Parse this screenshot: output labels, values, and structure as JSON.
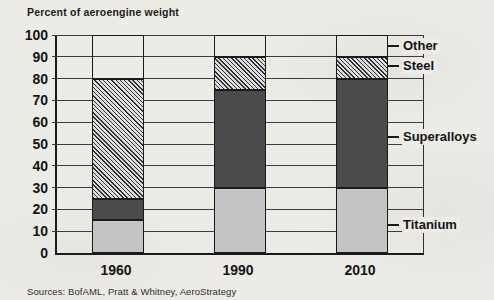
{
  "page": {
    "title": "Percent of aeroengine weight",
    "source_note": "Sources: BofAML, Pratt & Whitney, AeroStrategy"
  },
  "chart_data": {
    "type": "bar",
    "stacked": true,
    "title": "Percent of aeroengine weight",
    "categories": [
      "1960",
      "1990",
      "2010"
    ],
    "series": [
      {
        "name": "Titanium",
        "values": [
          15,
          30,
          30
        ],
        "pattern": "solid",
        "fill": "#c4c4c4"
      },
      {
        "name": "Superalloys",
        "values": [
          10,
          45,
          50
        ],
        "pattern": "solid",
        "fill": "#4b4b4b"
      },
      {
        "name": "Steel",
        "values": [
          55,
          15,
          10
        ],
        "pattern": "diagonal-hatch",
        "fill": "#dedede",
        "hatch_color": "#2f2f2f"
      },
      {
        "name": "Other",
        "values": [
          20,
          10,
          10
        ],
        "pattern": "transparent",
        "fill": "none"
      }
    ],
    "xlabel": "",
    "ylabel": "",
    "ylim": [
      0,
      100
    ],
    "ytick_step": 10,
    "yticks": [
      0,
      10,
      20,
      30,
      40,
      50,
      60,
      70,
      80,
      90,
      100
    ],
    "grid": true,
    "legend_position": "right-of-plot",
    "right_labels": [
      {
        "text": "Other",
        "at_value": 95
      },
      {
        "text": "Steel",
        "at_value": 86
      },
      {
        "text": "Superalloys",
        "at_value": 53
      },
      {
        "text": "Titanium",
        "at_value": 13
      }
    ],
    "colors": {
      "background": "#edebe6",
      "grid": "#3c3c3c",
      "axis": "#1a1a1a",
      "bar_outline": "#1a1a1a"
    }
  }
}
